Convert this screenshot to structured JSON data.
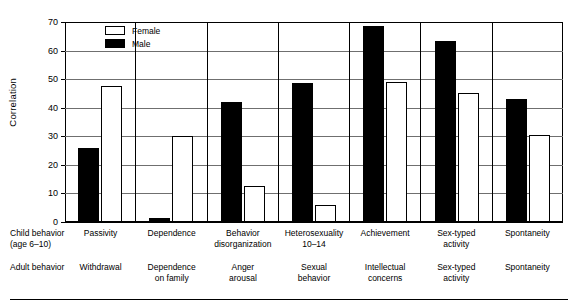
{
  "chart_data": {
    "type": "bar",
    "title": "",
    "xlabel": "",
    "ylabel": "Correlation",
    "ylim": [
      0,
      70
    ],
    "yticks": [
      0,
      10,
      20,
      30,
      40,
      50,
      60,
      70
    ],
    "grid": true,
    "legend_position": "top-left",
    "categories": [
      "Passivity",
      "Dependence",
      "Behavior disorganization",
      "Heterosexuality 10–14",
      "Achievement",
      "Sex-typed activity",
      "Spontaneity"
    ],
    "series": [
      {
        "name": "Female",
        "color": "#ffffff",
        "values": [
          47.5,
          30,
          12.5,
          6,
          49,
          45,
          30.5
        ]
      },
      {
        "name": "Male",
        "color": "#000000",
        "values": [
          26,
          1.5,
          42,
          48.5,
          68.5,
          63.5,
          43
        ]
      }
    ],
    "row_labels": {
      "child": "Child behavior (age 6–10)",
      "adult": "Adult behavior"
    },
    "child_behavior": [
      "Passivity",
      "Dependence",
      "Behavior disorganization",
      "Heterosexuality 10–14",
      "Achievement",
      "Sex-typed activity",
      "Spontaneity"
    ],
    "adult_behavior": [
      "Withdrawal",
      "Dependence on family",
      "Anger arousal",
      "Sexual behavior",
      "Intellectual concerns",
      "Sex-typed activity",
      "Spontaneity"
    ]
  },
  "axis": {
    "y_label": "Correlation",
    "y_ticks": [
      "70",
      "60",
      "50",
      "40",
      "30",
      "20",
      "10",
      "0"
    ]
  },
  "legend": {
    "items": [
      {
        "label": "Female",
        "fill": "white"
      },
      {
        "label": "Male",
        "fill": "black"
      }
    ]
  },
  "table": {
    "child_row_header_line1": "Child behavior",
    "child_row_header_line2": "(age 6–10)",
    "adult_row_header": "Adult behavior",
    "child_cells": [
      [
        "Passivity",
        ""
      ],
      [
        "Dependence",
        ""
      ],
      [
        "Behavior",
        "disorganization"
      ],
      [
        "Heterosexuality",
        "10–14"
      ],
      [
        "Achievement",
        ""
      ],
      [
        "Sex-typed",
        "activity"
      ],
      [
        "Spontaneity",
        ""
      ]
    ],
    "adult_cells": [
      [
        "Withdrawal",
        ""
      ],
      [
        "Dependence",
        "on family"
      ],
      [
        "Anger",
        "arousal"
      ],
      [
        "Sexual",
        "behavior"
      ],
      [
        "Intellectual",
        "concerns"
      ],
      [
        "Sex-typed",
        "activity"
      ],
      [
        "Spontaneity",
        ""
      ]
    ]
  }
}
